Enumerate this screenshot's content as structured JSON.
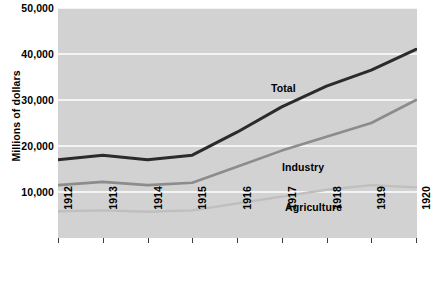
{
  "chart_data": {
    "type": "line",
    "title": "",
    "subtitle": "",
    "xlabel": "",
    "ylabel": "Millions of dollars",
    "x": [
      1912,
      1913,
      1914,
      1915,
      1916,
      1917,
      1918,
      1919,
      1920
    ],
    "categories": [
      "1912",
      "1913",
      "1914",
      "1915",
      "1916",
      "1917",
      "1918",
      "1919",
      "1920"
    ],
    "xtick_labels": [
      "1912",
      "1913",
      "1914",
      "1915",
      "1916",
      "1917",
      "1918",
      "1919",
      "1920"
    ],
    "ytick_labels": [
      "10,000",
      "20,000",
      "30,000",
      "40,000",
      "50,000"
    ],
    "ytick_values": [
      10000,
      20000,
      30000,
      40000,
      50000
    ],
    "ylim": [
      0,
      50000
    ],
    "xlim": [
      1912,
      1920
    ],
    "grid": "horizontal",
    "legend_position": "inline-annotations",
    "plot_background": "#d2d2d2",
    "gridline_color": "#ffffff",
    "series": [
      {
        "name": "Total",
        "color": "#2b2b2b",
        "line_width": 3.0,
        "label_text": "Total",
        "values": [
          17000,
          18000,
          17000,
          18000,
          23000,
          28500,
          33000,
          36500,
          41000
        ]
      },
      {
        "name": "Industry",
        "color": "#8c8c8c",
        "line_width": 2.6,
        "label_text": "Industry",
        "values": [
          11500,
          12200,
          11500,
          12000,
          15500,
          19000,
          22000,
          25000,
          30000
        ]
      },
      {
        "name": "Agriculture",
        "color": "#bfbfbf",
        "line_width": 2.4,
        "label_text": "Agriculture",
        "values": [
          5800,
          6000,
          5700,
          6000,
          7500,
          9000,
          10500,
          11500,
          11000
        ]
      }
    ],
    "annotations": [
      {
        "text": "Total",
        "x_px": 271,
        "y_px": 89
      },
      {
        "text": "Industry",
        "x_px": 282,
        "y_px": 168
      },
      {
        "text": "Agriculture",
        "x_px": 285,
        "y_px": 208
      }
    ]
  }
}
